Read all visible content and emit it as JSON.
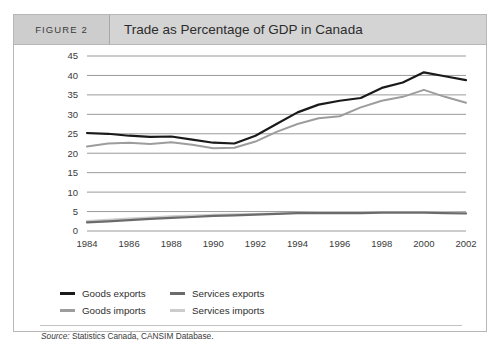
{
  "figure": {
    "number_label": "FIGURE 2",
    "title": "Trade as Percentage of GDP in Canada",
    "source_label": "Source:",
    "source_text": " Statistics Canada, CANSIM Database."
  },
  "colors": {
    "goods_exports": "#1a1a1a",
    "goods_imports": "#9d9d9d",
    "services_exports": "#6b6b6b",
    "services_imports": "#cccccc",
    "gridline": "#6e6e6e",
    "header_band": "#d4d4d4",
    "header_number_cell": "#cdcdcd",
    "frame_border": "#b7b7b7",
    "text": "#2c2c2c"
  },
  "legend": [
    {
      "label": "Goods exports",
      "color": "#1a1a1a"
    },
    {
      "label": "Services exports",
      "color": "#6b6b6b"
    },
    {
      "label": "Goods imports",
      "color": "#9d9d9d"
    },
    {
      "label": "Services imports",
      "color": "#cccccc"
    }
  ],
  "chart_data": {
    "type": "line",
    "title": "Trade as Percentage of GDP in Canada",
    "xlabel": "",
    "ylabel": "",
    "grid": true,
    "legend_position": "bottom-left",
    "x": [
      1984,
      1985,
      1986,
      1987,
      1988,
      1989,
      1990,
      1991,
      1992,
      1993,
      1994,
      1995,
      1996,
      1997,
      1998,
      1999,
      2000,
      2001,
      2002
    ],
    "xticks": [
      "1984",
      "1986",
      "1988",
      "1990",
      "1992",
      "1994",
      "1996",
      "1998",
      "2000",
      "2002"
    ],
    "yticks": [
      "0",
      "5",
      "10",
      "15",
      "20",
      "25",
      "30",
      "35",
      "40",
      "45"
    ],
    "ylim": [
      0,
      45
    ],
    "xlim": [
      1984,
      2002
    ],
    "series": [
      {
        "name": "Goods exports",
        "color": "#1a1a1a",
        "values": [
          25.2,
          25.0,
          24.5,
          24.2,
          24.3,
          23.5,
          22.7,
          22.5,
          24.5,
          27.5,
          30.5,
          32.5,
          33.5,
          34.2,
          36.8,
          38.2,
          40.8,
          39.8,
          38.8
        ]
      },
      {
        "name": "Goods imports",
        "color": "#9d9d9d",
        "values": [
          21.7,
          22.5,
          22.7,
          22.4,
          22.8,
          22.2,
          21.3,
          21.4,
          23.0,
          25.5,
          27.5,
          29.0,
          29.5,
          31.8,
          33.5,
          34.5,
          36.3,
          34.5,
          33.0
        ]
      },
      {
        "name": "Services exports",
        "color": "#6b6b6b",
        "values": [
          2.2,
          2.5,
          2.8,
          3.1,
          3.4,
          3.6,
          3.9,
          4.0,
          4.2,
          4.4,
          4.6,
          4.6,
          4.6,
          4.6,
          4.7,
          4.7,
          4.7,
          4.6,
          4.5
        ]
      },
      {
        "name": "Services imports",
        "color": "#cccccc",
        "values": [
          2.6,
          2.9,
          3.2,
          3.5,
          3.8,
          4.0,
          4.2,
          4.3,
          4.4,
          4.5,
          4.7,
          4.8,
          4.8,
          4.8,
          4.9,
          4.9,
          4.9,
          4.8,
          4.7
        ]
      }
    ]
  }
}
